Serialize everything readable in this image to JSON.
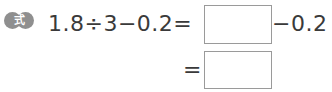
{
  "badge": {
    "label": "式",
    "color": "#8f8f8f"
  },
  "equation": {
    "line1_left": "1.8÷3−0.2=",
    "line1_right": "−0.2",
    "line2_left": "=",
    "answer_box_1": "",
    "answer_box_2": ""
  }
}
